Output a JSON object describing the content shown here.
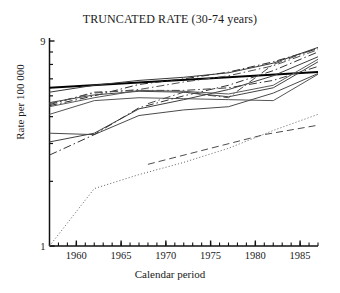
{
  "chart_data": {
    "type": "line",
    "title": "TRUNCATED RATE (30-74 years)",
    "xlabel": "Calendar period",
    "ylabel": "Rate per 100 000",
    "yscale": "log",
    "ylim": [
      1,
      9
    ],
    "xlim": [
      1957,
      1987
    ],
    "grid": false,
    "legend": "none",
    "ytick_labels": [
      "1",
      "9"
    ],
    "ytick_values": [
      1,
      9
    ],
    "yminor_ticks": [
      2,
      3,
      4,
      5,
      6,
      7,
      8
    ],
    "xtick_labels": [
      "1960",
      "1965",
      "1970",
      "1975",
      "1980",
      "1985"
    ],
    "xtick_values": [
      1960,
      1965,
      1970,
      1975,
      1980,
      1985
    ],
    "xminor_step": 1,
    "series": [
      {
        "name": "series-1",
        "style": "solid-thick",
        "color": "#000000",
        "x": [
          1957,
          1987
        ],
        "values": [
          5.45,
          6.45
        ]
      },
      {
        "name": "series-2",
        "style": "dashdot",
        "color": "#2a2a2a",
        "x": [
          1957,
          1962,
          1967,
          1972,
          1977,
          1982,
          1987
        ],
        "values": [
          4.5,
          5.0,
          5.65,
          6.0,
          6.45,
          7.2,
          8.3
        ]
      },
      {
        "name": "series-3",
        "style": "solid",
        "color": "#444444",
        "x": [
          1957,
          1962,
          1967,
          1972,
          1977,
          1982,
          1987
        ],
        "values": [
          4.65,
          5.05,
          5.25,
          5.2,
          4.95,
          5.45,
          7.2
        ]
      },
      {
        "name": "series-4",
        "style": "dashdot",
        "color": "#3a3a3a",
        "x": [
          1957,
          1962,
          1967,
          1972,
          1977,
          1982,
          1987
        ],
        "values": [
          4.55,
          5.2,
          5.3,
          5.3,
          5.45,
          5.9,
          6.85
        ]
      },
      {
        "name": "series-5",
        "style": "solid",
        "color": "#555555",
        "x": [
          1957,
          1962,
          1967,
          1972,
          1977,
          1982,
          1987
        ],
        "values": [
          4.1,
          4.75,
          4.9,
          4.85,
          4.8,
          4.75,
          6.3
        ]
      },
      {
        "name": "series-6",
        "style": "solid",
        "color": "#4a4a4a",
        "x": [
          1957,
          1962,
          1967,
          1972,
          1977,
          1982,
          1987
        ],
        "values": [
          3.35,
          3.3,
          4.05,
          4.3,
          4.45,
          5.15,
          6.35
        ]
      },
      {
        "name": "series-7",
        "style": "solid",
        "color": "#3f3f3f",
        "x": [
          1957,
          1962,
          1967,
          1972,
          1977,
          1982,
          1987
        ],
        "values": [
          3.05,
          3.35,
          4.35,
          4.8,
          5.35,
          6.2,
          7.6
        ]
      },
      {
        "name": "series-8",
        "style": "dashdot",
        "color": "#333333",
        "x": [
          1957,
          1962,
          1967,
          1972,
          1977,
          1982,
          1987
        ],
        "values": [
          2.65,
          3.3,
          4.4,
          5.0,
          5.6,
          6.55,
          8.0
        ]
      },
      {
        "name": "series-9",
        "style": "dashdot",
        "color": "#4b4b4b",
        "x": [
          1968,
          1972,
          1977,
          1982,
          1987
        ],
        "values": [
          4.6,
          5.2,
          4.9,
          7.0,
          8.35
        ]
      },
      {
        "name": "series-10",
        "style": "dashdot",
        "color": "#505050",
        "x": [
          1957,
          1962,
          1967,
          1972,
          1977,
          1982,
          1987
        ],
        "values": [
          4.6,
          5.15,
          5.35,
          5.8,
          6.2,
          6.9,
          8.2
        ]
      },
      {
        "name": "series-11",
        "style": "solid",
        "color": "#5a5a5a",
        "x": [
          1957,
          1962,
          1967,
          1972,
          1977,
          1982,
          1987
        ],
        "values": [
          4.45,
          4.9,
          5.3,
          5.25,
          5.1,
          5.6,
          7.4
        ]
      },
      {
        "name": "series-12",
        "style": "dashed",
        "color": "#4d4d4d",
        "x": [
          1968,
          1975,
          1981,
          1987
        ],
        "values": [
          2.4,
          2.85,
          3.3,
          3.65
        ]
      },
      {
        "name": "series-13",
        "style": "dotted",
        "color": "#5e5e5e",
        "x": [
          1957,
          1962,
          1967,
          1972,
          1977,
          1982,
          1987
        ],
        "values": [
          1.0,
          1.85,
          2.15,
          2.45,
          2.85,
          3.45,
          4.1
        ]
      },
      {
        "name": "series-14",
        "style": "solid",
        "color": "#383838",
        "x": [
          1957,
          1962,
          1967,
          1972,
          1977,
          1982,
          1987
        ],
        "values": [
          5.2,
          5.6,
          5.9,
          6.1,
          6.4,
          7.1,
          8.4
        ]
      }
    ]
  }
}
